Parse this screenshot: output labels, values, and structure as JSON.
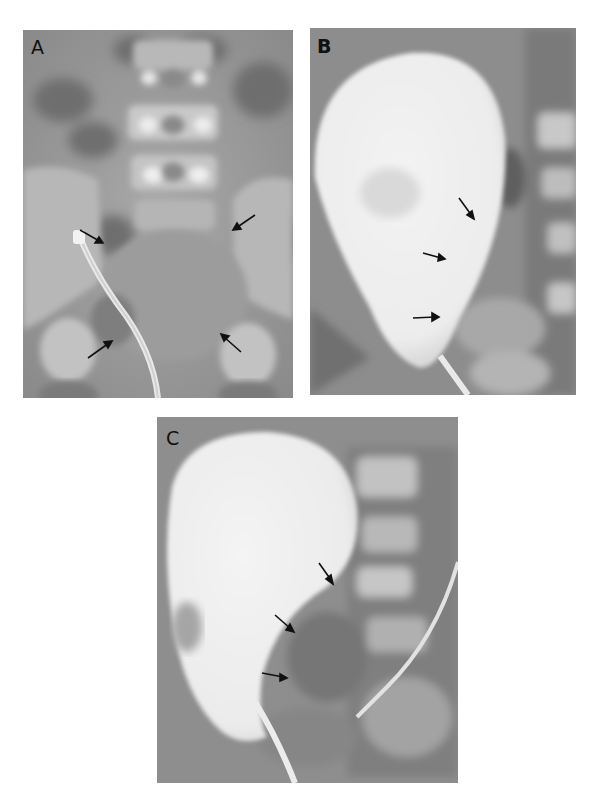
{
  "figure": {
    "panels": [
      {
        "id": "A",
        "label": "A",
        "description": "Frontal radiograph of pelvis with catheter in place; arrows outline bladder margins",
        "arrow_count": 4
      },
      {
        "id": "B",
        "label": "B",
        "description": "Contrast-filled, distended bladder (teardrop shape) with catheter at base; arrows along right wall",
        "arrow_count": 3
      },
      {
        "id": "C",
        "label": "C",
        "description": "Oblique view of contrast-filled bladder with catheter; arrows indicate indentation of bladder wall",
        "arrow_count": 3
      }
    ]
  }
}
